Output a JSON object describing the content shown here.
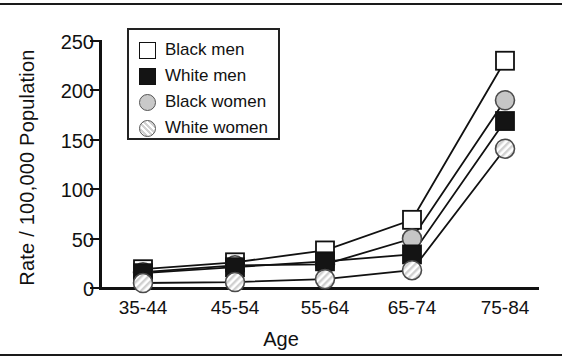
{
  "figure": {
    "ylabel": "Rate / 100,000 Population",
    "xlabel": "Age"
  },
  "axes": {
    "y_ticks": [
      "0",
      "50",
      "100",
      "150",
      "200",
      "250"
    ],
    "x_ticks": [
      "35-44",
      "45-54",
      "55-64",
      "65-74",
      "75-84"
    ]
  },
  "legend": {
    "items": [
      {
        "label": "Black men",
        "marker": "white-square",
        "color": "#ffffff"
      },
      {
        "label": "White men",
        "marker": "black-square",
        "color": "#141414"
      },
      {
        "label": "Black women",
        "marker": "grey-circle",
        "color": "#c9c9c9"
      },
      {
        "label": "White women",
        "marker": "hatched-circle",
        "color": "#d2d2d2"
      }
    ]
  },
  "chart_data": {
    "type": "line",
    "title": "",
    "xlabel": "Age",
    "ylabel": "Rate / 100,000 Population",
    "categories": [
      "35-44",
      "45-54",
      "55-64",
      "65-74",
      "75-84"
    ],
    "ylim": [
      0,
      250
    ],
    "yticks": [
      0,
      50,
      100,
      150,
      200,
      250
    ],
    "grid": false,
    "legend_position": "upper-left-inset",
    "series": [
      {
        "name": "Black men",
        "marker": "white-square",
        "values": [
          18,
          25,
          37,
          68,
          229
        ]
      },
      {
        "name": "White men",
        "marker": "black-square",
        "values": [
          14,
          20,
          26,
          33,
          168
        ]
      },
      {
        "name": "Black women",
        "marker": "grey-circle",
        "values": [
          15,
          22,
          23,
          49,
          189
        ]
      },
      {
        "name": "White women",
        "marker": "hatched-circle",
        "values": [
          4,
          5,
          8,
          17,
          140
        ]
      }
    ]
  }
}
